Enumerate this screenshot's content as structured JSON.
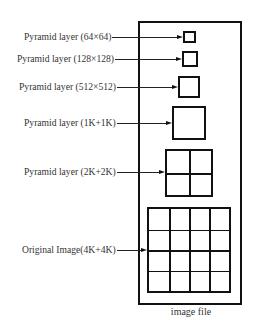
{
  "diagram": {
    "type": "image pyramid",
    "container_caption": "image file",
    "layers": [
      {
        "label": "Pyramid layer (64×64)",
        "grid": 1,
        "box": {
          "x": 183,
          "y": 31,
          "w": 13,
          "h": 12
        },
        "arrow_y": 37,
        "label_x": 24,
        "label_end": 72
      },
      {
        "label": "Pyramid layer (128×128)",
        "grid": 1,
        "box": {
          "x": 182,
          "y": 51,
          "w": 16,
          "h": 16
        },
        "arrow_y": 59,
        "label_x": 17,
        "label_end": 121
      },
      {
        "label": "Pyramid layer (512×512)",
        "grid": 1,
        "box": {
          "x": 178,
          "y": 76,
          "w": 22,
          "h": 22
        },
        "arrow_y": 87,
        "label_x": 19,
        "label_end": 121
      },
      {
        "label": "Pyramid layer (1K+1K)",
        "grid": 1,
        "box": {
          "x": 172,
          "y": 106,
          "w": 34,
          "h": 34
        },
        "arrow_y": 123,
        "label_x": 24,
        "label_end": 123
      },
      {
        "label": "Pyramid layer (2K+2K)",
        "grid": 2,
        "box": {
          "x": 165,
          "y": 149,
          "w": 48,
          "h": 48
        },
        "arrow_y": 172,
        "label_x": 24,
        "label_end": 124
      },
      {
        "label": "Original Image(4K+4K)",
        "grid": 4,
        "box": {
          "x": 147,
          "y": 207,
          "w": 84,
          "h": 86
        },
        "arrow_y": 250,
        "label_x": 22,
        "label_end": 122
      }
    ]
  }
}
